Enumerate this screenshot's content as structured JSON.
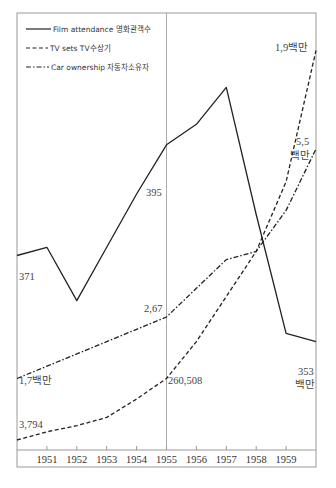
{
  "chart_data": {
    "type": "line",
    "title": "",
    "xlabel": "",
    "ylabel": "",
    "x": [
      1950,
      1951,
      1952,
      1953,
      1954,
      1955,
      1956,
      1957,
      1958,
      1959,
      1960
    ],
    "tick_labels": [
      "1951",
      "1952",
      "1953",
      "1954",
      "1955",
      "1956",
      "1957",
      "1958",
      "1959"
    ],
    "xlim": [
      1950,
      1960
    ],
    "reference_line_x": 1955,
    "grid": false,
    "legend_position": "top-left",
    "legend": [
      {
        "name": "Film attendance  영화관객수",
        "style": "solid"
      },
      {
        "name": "TV sets  TV수상기",
        "style": "dashed"
      },
      {
        "name": "Car ownership  자동차소유자",
        "style": "dash-dot"
      }
    ],
    "series": [
      {
        "name": "Film attendance",
        "style": "solid",
        "note": "relative index (normalized 0-1 of plotting scale)",
        "values": [
          0.45,
          0.47,
          0.34,
          0.47,
          0.6,
          0.72,
          0.77,
          0.86,
          0.55,
          0.26,
          0.24
        ]
      },
      {
        "name": "TV sets",
        "style": "dashed",
        "values": [
          0.0,
          0.02,
          0.035,
          0.055,
          0.1,
          0.15,
          0.24,
          0.35,
          0.46,
          0.63,
          0.95
        ]
      },
      {
        "name": "Car ownership",
        "style": "dash-dot",
        "values": [
          0.15,
          0.18,
          0.21,
          0.24,
          0.27,
          0.3,
          0.37,
          0.44,
          0.46,
          0.56,
          0.71
        ]
      }
    ],
    "annotations": [
      {
        "text": "371",
        "series": "Film attendance",
        "x": 1951
      },
      {
        "text": "395",
        "series": "Film attendance",
        "x": 1955
      },
      {
        "text": "353",
        "series": "Film attendance",
        "x": 1960
      },
      {
        "text": "백만",
        "series": "Film attendance",
        "x": 1960
      },
      {
        "text": "3,794",
        "series": "TV sets",
        "x": 1950
      },
      {
        "text": "260,508",
        "series": "TV sets",
        "x": 1955
      },
      {
        "text": "1,9백만",
        "series": "TV sets",
        "x": 1960
      },
      {
        "text": "1,7백만",
        "series": "Car ownership",
        "x": 1950
      },
      {
        "text": "2,67",
        "series": "Car ownership",
        "x": 1955
      },
      {
        "text": "5,5",
        "series": "Car ownership",
        "x": 1960
      },
      {
        "text": "백만",
        "series": "Car ownership",
        "x": 1960
      }
    ]
  }
}
